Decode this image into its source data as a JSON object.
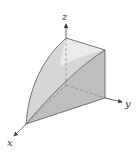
{
  "figure": {
    "type": "3d-solid-diagram",
    "axes": {
      "x": {
        "label": "x"
      },
      "y": {
        "label": "y"
      },
      "z": {
        "label": "z"
      }
    },
    "colors": {
      "line": "#555555",
      "dashed": "#888888",
      "face_left": "#d4d4d4",
      "face_top": "#e8e8e8",
      "face_right": "#bdbdbd",
      "face_bottom": "#f0f0f0",
      "background": "#ffffff"
    }
  }
}
